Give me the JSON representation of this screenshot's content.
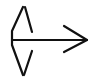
{
  "icon": {
    "name": "arrow-right-from-split-icon",
    "stroke_color": "#111111",
    "background": "#ffffff",
    "stroke_width": 2.2
  }
}
